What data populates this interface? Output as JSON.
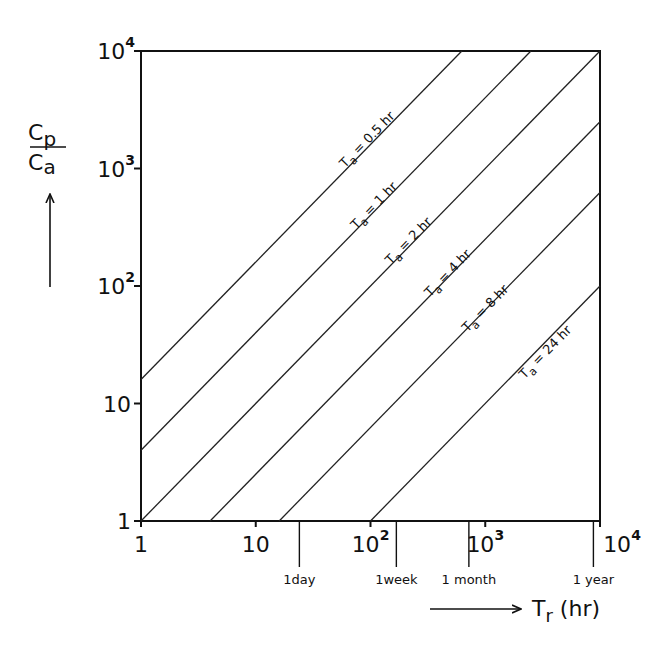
{
  "chart_data": {
    "type": "line",
    "title": "",
    "xlabel": "T_r (hr)",
    "ylabel": "C_p / C_a",
    "xscale": "log",
    "yscale": "log",
    "xlim": [
      1,
      10000
    ],
    "ylim": [
      1,
      10000
    ],
    "grid": false,
    "legend": "inline labels along lines",
    "x_ticks": [
      {
        "value": 1,
        "base": "1",
        "exp": ""
      },
      {
        "value": 10,
        "base": "10",
        "exp": ""
      },
      {
        "value": 100,
        "base": "10",
        "exp": "2"
      },
      {
        "value": 1000,
        "base": "10",
        "exp": "3"
      },
      {
        "value": 10000,
        "base": "10",
        "exp": "4"
      }
    ],
    "y_ticks": [
      {
        "value": 1,
        "base": "1",
        "exp": ""
      },
      {
        "value": 10,
        "base": "10",
        "exp": ""
      },
      {
        "value": 100,
        "base": "10",
        "exp": "2"
      },
      {
        "value": 1000,
        "base": "10",
        "exp": "3"
      },
      {
        "value": 10000,
        "base": "10",
        "exp": "4"
      }
    ],
    "time_markers": [
      {
        "label": "1day",
        "value": 24
      },
      {
        "label": "1week",
        "value": 168
      },
      {
        "label": "1 month",
        "value": 720
      },
      {
        "label": "1 year",
        "value": 8760
      }
    ],
    "series": [
      {
        "name": "T_a = 0.5 hr",
        "label_prefix": "T",
        "label_sub": "a",
        "label_text": "= 0.5 hr",
        "points": [
          [
            1,
            16
          ],
          [
            625,
            10000
          ]
        ],
        "label_at": [
          60,
          1000
        ]
      },
      {
        "name": "T_a = 1 hr",
        "label_prefix": "T",
        "label_sub": "a",
        "label_text": "=    1 hr",
        "points": [
          [
            1,
            4
          ],
          [
            2500,
            10000
          ]
        ],
        "label_at": [
          75,
          300
        ]
      },
      {
        "name": "T_a = 2 hr",
        "label_prefix": "T",
        "label_sub": "a",
        "label_text": "=    2 hr",
        "points": [
          [
            1,
            1
          ],
          [
            10000,
            10000
          ]
        ],
        "label_at": [
          150,
          150
        ]
      },
      {
        "name": "T_a = 4 hr",
        "label_prefix": "T",
        "label_sub": "a",
        "label_text": "=    4 hr",
        "points": [
          [
            4,
            1
          ],
          [
            10000,
            2500
          ]
        ],
        "label_at": [
          330,
          80
        ]
      },
      {
        "name": "T_a = 8 hr",
        "label_prefix": "T",
        "label_sub": "a",
        "label_text": "=    8 hr",
        "points": [
          [
            16,
            1
          ],
          [
            10000,
            625
          ]
        ],
        "label_at": [
          700,
          40
        ]
      },
      {
        "name": "T_a = 24 hr",
        "label_prefix": "T",
        "label_sub": "a",
        "label_text": "= 24 hr",
        "points": [
          [
            100,
            1
          ],
          [
            10000,
            100
          ]
        ],
        "label_at": [
          2200,
          16
        ]
      }
    ]
  },
  "axis_labels": {
    "y_num": "C",
    "y_num_sub": "p",
    "y_den": "C",
    "y_den_sub": "a",
    "x_main": "T",
    "x_sub": "r",
    "x_unit": " (hr)"
  }
}
